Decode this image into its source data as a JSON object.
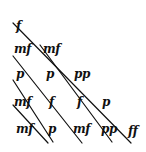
{
  "diagram": {
    "ink_color": "#111111",
    "rows": [
      [
        "f"
      ],
      [
        "mf",
        "mf"
      ],
      [
        "p",
        "p",
        "pp"
      ],
      [
        "mf",
        "f",
        "f",
        "p"
      ],
      [
        "mf",
        "p",
        "mf",
        "pp",
        "ff"
      ]
    ],
    "marks": [
      {
        "text": "f",
        "x": 16,
        "y": 20
      },
      {
        "text": "mf",
        "x": 14,
        "y": 43
      },
      {
        "text": "mf",
        "x": 43,
        "y": 43
      },
      {
        "text": "p",
        "x": 16,
        "y": 68
      },
      {
        "text": "p",
        "x": 46,
        "y": 68
      },
      {
        "text": "pp",
        "x": 74,
        "y": 68
      },
      {
        "text": "mf",
        "x": 14,
        "y": 96
      },
      {
        "text": "f",
        "x": 49,
        "y": 96
      },
      {
        "text": "f",
        "x": 77,
        "y": 96
      },
      {
        "text": "p",
        "x": 102,
        "y": 96
      },
      {
        "text": "mf",
        "x": 16,
        "y": 123
      },
      {
        "text": "p",
        "x": 48,
        "y": 123
      },
      {
        "text": "mf",
        "x": 73,
        "y": 123
      },
      {
        "text": "pp",
        "x": 101,
        "y": 123
      },
      {
        "text": "ff",
        "x": 128,
        "y": 125
      }
    ]
  }
}
